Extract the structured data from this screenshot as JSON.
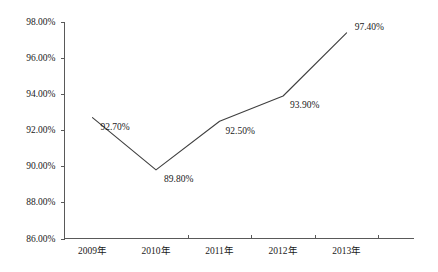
{
  "chart_data": {
    "type": "line",
    "title": "",
    "xlabel": "",
    "ylabel": "",
    "categories": [
      "2009年",
      "2010年",
      "2011年",
      "2012年",
      "2013年"
    ],
    "values": [
      92.7,
      89.8,
      92.5,
      93.9,
      97.4
    ],
    "point_labels": [
      "92.70%",
      "89.80%",
      "92.50%",
      "93.90%",
      "97.40%"
    ],
    "ylim": [
      86.0,
      98.0
    ],
    "ytick_values": [
      98.0,
      96.0,
      94.0,
      92.0,
      90.0,
      88.0,
      86.0
    ],
    "ytick_labels": [
      "98.00%",
      "96.00%",
      "94.00%",
      "92.00%",
      "90.00%",
      "88.00%",
      "86.00%"
    ],
    "grid": false,
    "legend": false,
    "legend_position": "none",
    "markers": false,
    "series": [
      {
        "name": "",
        "values": [
          92.7,
          89.8,
          92.5,
          93.9,
          97.4
        ]
      }
    ],
    "colors": {
      "line": "#3f3f3f",
      "axis": "#595959",
      "text": "#1a1a1a",
      "background": "#ffffff"
    }
  }
}
